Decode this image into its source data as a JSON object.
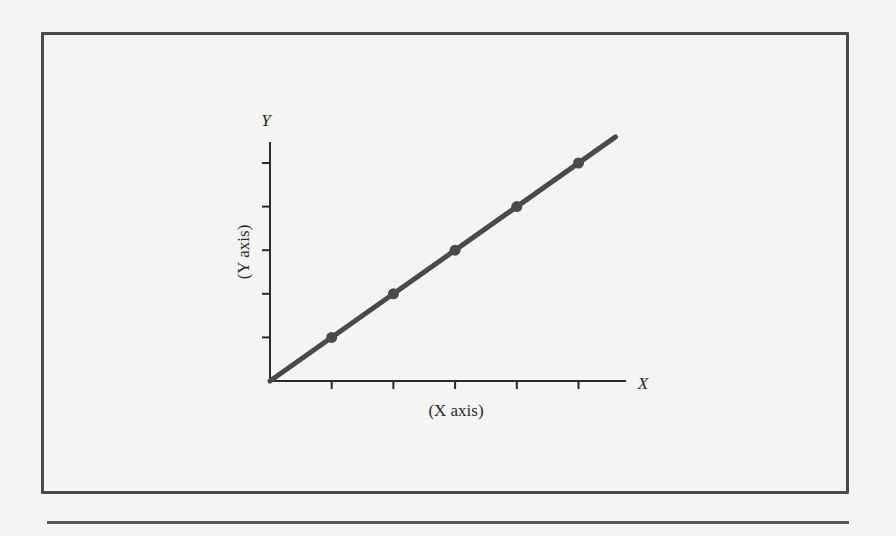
{
  "chart_data": {
    "type": "line",
    "title": "",
    "xlabel": "(X axis)",
    "ylabel": "(Y axis)",
    "x_axis_end_label": "X",
    "y_axis_end_label": "Y",
    "x": [
      0,
      1,
      2,
      3,
      4,
      5
    ],
    "series": [
      {
        "name": "linear",
        "values": [
          0,
          1,
          2,
          3,
          4,
          5
        ],
        "markers_at": [
          1,
          2,
          3,
          4,
          5
        ]
      }
    ],
    "x_ticks": 5,
    "y_ticks": 5,
    "tick_labels": [],
    "grid": false,
    "legend": null,
    "line_color": "#4a4a4a",
    "axis_color": "#2a2a2a"
  },
  "figure": {
    "x_axis_caption": "(X axis)",
    "y_axis_caption": "(Y axis)",
    "x_letter": "X",
    "y_letter": "Y"
  }
}
